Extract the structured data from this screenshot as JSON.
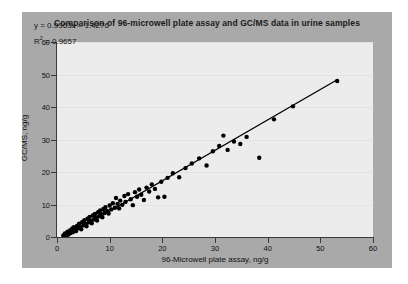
{
  "figure": {
    "title": "Comparison of 96-microwell plate assay and GC/MS data in urine samples",
    "panel_color": "#a9a9a9",
    "plot_color": "#ececed"
  },
  "annotations": {
    "equation": "y = 0.9363x – 1.4276",
    "r_squared_prefix": "R",
    "r_squared_sup": "2",
    "r_squared_value": " = 0.9657"
  },
  "chart_data": {
    "type": "scatter",
    "title": "Comparison of 96-microwell plate assay and GC/MS data in urine samples",
    "xlabel": "96-Microwell plate assay, ng/g",
    "ylabel": "GC/MS, ng/g",
    "xlim": [
      0,
      60
    ],
    "ylim": [
      0,
      60
    ],
    "xticks": [
      0,
      10,
      20,
      30,
      40,
      50,
      60
    ],
    "yticks": [
      0,
      10,
      20,
      30,
      40,
      50,
      60
    ],
    "grid": "horizontal-faint",
    "legend": "none",
    "marker": {
      "shape": "circle",
      "color": "#000000",
      "size": 2.2
    },
    "fit_line": {
      "equation": "y = 0.9363x – 1.4276",
      "slope": 0.9363,
      "intercept": -1.4276,
      "r_squared": 0.9657,
      "x_start": 1.0,
      "x_end": 53.2,
      "color": "#000000",
      "width": 1.3
    },
    "points": [
      [
        1.2,
        0.5
      ],
      [
        1.5,
        1.1
      ],
      [
        1.8,
        0.3
      ],
      [
        2.0,
        1.6
      ],
      [
        2.2,
        0.8
      ],
      [
        2.5,
        2.1
      ],
      [
        2.6,
        1.2
      ],
      [
        2.9,
        2.6
      ],
      [
        3.0,
        1.5
      ],
      [
        3.2,
        3.0
      ],
      [
        3.4,
        2.2
      ],
      [
        3.6,
        1.8
      ],
      [
        3.8,
        3.4
      ],
      [
        4.0,
        2.7
      ],
      [
        4.2,
        4.1
      ],
      [
        4.4,
        3.1
      ],
      [
        4.6,
        2.4
      ],
      [
        4.8,
        4.6
      ],
      [
        5.0,
        3.6
      ],
      [
        5.2,
        5.2
      ],
      [
        5.4,
        4.0
      ],
      [
        5.6,
        3.3
      ],
      [
        5.8,
        5.6
      ],
      [
        6.0,
        4.5
      ],
      [
        6.2,
        6.2
      ],
      [
        6.4,
        5.0
      ],
      [
        6.6,
        4.2
      ],
      [
        6.8,
        6.6
      ],
      [
        7.0,
        5.4
      ],
      [
        7.2,
        7.1
      ],
      [
        7.4,
        6.0
      ],
      [
        7.6,
        5.1
      ],
      [
        7.8,
        7.6
      ],
      [
        8.0,
        6.4
      ],
      [
        8.2,
        8.2
      ],
      [
        8.4,
        7.0
      ],
      [
        8.6,
        6.1
      ],
      [
        8.8,
        8.6
      ],
      [
        9.0,
        7.4
      ],
      [
        9.2,
        9.2
      ],
      [
        9.5,
        8.0
      ],
      [
        9.8,
        7.2
      ],
      [
        10.0,
        9.7
      ],
      [
        10.3,
        8.5
      ],
      [
        10.6,
        10.4
      ],
      [
        11.0,
        9.0
      ],
      [
        11.2,
        12.0
      ],
      [
        11.5,
        10.2
      ],
      [
        11.8,
        8.8
      ],
      [
        12.0,
        11.2
      ],
      [
        12.4,
        9.9
      ],
      [
        12.8,
        12.6
      ],
      [
        13.0,
        10.8
      ],
      [
        13.5,
        13.2
      ],
      [
        14.0,
        11.6
      ],
      [
        14.4,
        9.8
      ],
      [
        14.8,
        13.8
      ],
      [
        15.2,
        12.4
      ],
      [
        15.6,
        14.6
      ],
      [
        16.0,
        13.0
      ],
      [
        16.5,
        11.4
      ],
      [
        17.0,
        15.2
      ],
      [
        17.5,
        14.0
      ],
      [
        18.0,
        16.2
      ],
      [
        18.6,
        14.8
      ],
      [
        19.2,
        12.2
      ],
      [
        19.8,
        17.0
      ],
      [
        20.4,
        12.4
      ],
      [
        21.0,
        18.2
      ],
      [
        22.0,
        19.6
      ],
      [
        23.2,
        18.4
      ],
      [
        24.4,
        21.2
      ],
      [
        25.6,
        22.6
      ],
      [
        27.0,
        24.2
      ],
      [
        28.4,
        22.0
      ],
      [
        29.6,
        26.4
      ],
      [
        30.8,
        28.0
      ],
      [
        31.6,
        31.2
      ],
      [
        32.4,
        26.8
      ],
      [
        33.6,
        29.4
      ],
      [
        34.8,
        28.6
      ],
      [
        36.0,
        30.8
      ],
      [
        38.4,
        24.4
      ],
      [
        41.2,
        36.2
      ],
      [
        44.8,
        40.2
      ],
      [
        53.2,
        48.0
      ]
    ]
  },
  "icons": {
    "plot_area": "scatter-plot-area"
  }
}
